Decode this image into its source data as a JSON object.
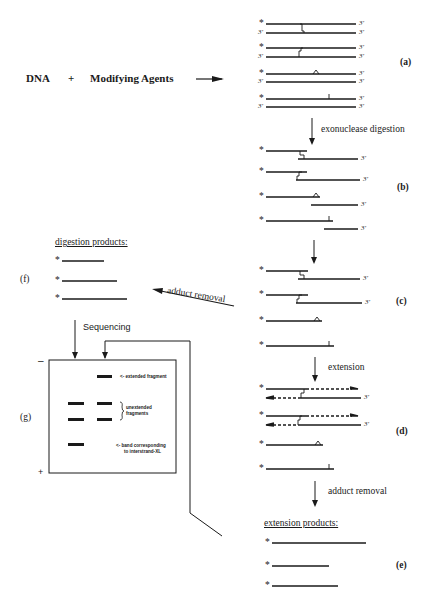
{
  "title": {
    "dna": "DNA",
    "plus": "+",
    "agents": "Modifying Agents"
  },
  "steps": {
    "a": {
      "label": "(a)"
    },
    "b": {
      "label": "(b)",
      "arrow_text": "exonuclease digestion"
    },
    "c": {
      "label": "(c)"
    },
    "d": {
      "label": "(d)",
      "arrow_text": "extension"
    },
    "e": {
      "label": "(e)",
      "arrow_text": "adduct removal",
      "heading": "extension products:"
    },
    "f": {
      "label": "(f)",
      "heading": "digestion products:",
      "arrow_text": "adduct removal"
    },
    "g": {
      "label": "(g)",
      "arrow_text": "Sequencing",
      "minus": "–",
      "plus": "+",
      "annotations": {
        "extended": "<- extended fragment",
        "unextended_line1": "unextended",
        "unextended_line2": "fragments",
        "xl_line1": "<- band corresponding",
        "xl_line2": "to interstrand-XL"
      }
    }
  },
  "strand_marks": {
    "five_prime": "*",
    "three_prime": "3'"
  }
}
